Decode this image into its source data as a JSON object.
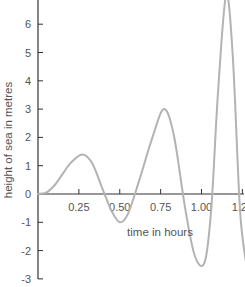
{
  "chart_data": {
    "type": "line",
    "title": "",
    "xlabel": "time in hours",
    "ylabel": "height of sea in metres",
    "xlim": [
      0,
      1.3
    ],
    "ylim": [
      -3,
      7
    ],
    "x_ticks": [
      "0.25",
      "0.50",
      "0.75",
      "1.00",
      "1.25"
    ],
    "y_ticks": [
      "7",
      "6",
      "5",
      "4",
      "3",
      "2",
      "1",
      "0",
      "-1",
      "-2",
      "-3"
    ],
    "grid": false,
    "legend": null,
    "series": [
      {
        "name": "sea height",
        "color": "#b3b3b3",
        "x": [
          0,
          0.05,
          0.1,
          0.15,
          0.2,
          0.27,
          0.33,
          0.4,
          0.45,
          0.5,
          0.55,
          0.62,
          0.7,
          0.77,
          0.83,
          0.9,
          0.96,
          1.02,
          1.06,
          1.1,
          1.15,
          1.19,
          1.23,
          1.25,
          1.28
        ],
        "y": [
          0,
          0.05,
          0.3,
          0.7,
          1.1,
          1.4,
          1.1,
          0.1,
          -0.6,
          -1.0,
          -0.7,
          0.5,
          2.0,
          3.0,
          2.1,
          -0.5,
          -2.2,
          -2.4,
          -0.5,
          3.5,
          7.0,
          5.0,
          0.0,
          -1.5,
          -2.7
        ]
      }
    ]
  },
  "axis_color": "#333333",
  "curve_color": "#b3b3b3"
}
